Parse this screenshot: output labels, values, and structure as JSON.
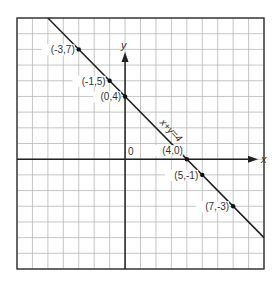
{
  "chart_data": {
    "type": "line",
    "title": "",
    "xlabel": "x",
    "ylabel": "y",
    "xlim": [
      -7,
      9
    ],
    "ylim": [
      -7,
      9
    ],
    "grid": true,
    "grid_step": 1,
    "origin_label": "0",
    "series": [
      {
        "name": "x+y=4",
        "equation": "x+y=4",
        "slope": -1,
        "intercept": 4
      }
    ],
    "points": [
      {
        "x": -3,
        "y": 7,
        "label": "(-3,7)",
        "label_side": "left"
      },
      {
        "x": -1,
        "y": 5,
        "label": "(-1,5)",
        "label_side": "left"
      },
      {
        "x": 0,
        "y": 4,
        "label": "(0,4)",
        "label_side": "left"
      },
      {
        "x": 4,
        "y": 0,
        "label": "(4,0)",
        "label_side": "above-left"
      },
      {
        "x": 5,
        "y": -1,
        "label": "(5,-1)",
        "label_side": "left"
      },
      {
        "x": 7,
        "y": -3,
        "label": "(7,-3)",
        "label_side": "left"
      }
    ],
    "line_label": "x+y=4"
  }
}
